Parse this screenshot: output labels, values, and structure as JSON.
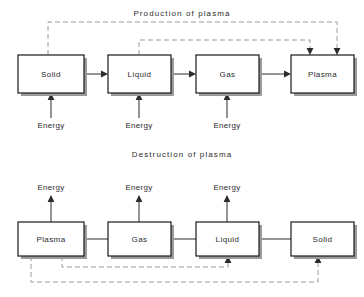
{
  "figure": {
    "title_top": "Production of  plasma",
    "title_bottom": "Destruction of  plasma"
  },
  "production": {
    "title": "Production of  plasma",
    "states": [
      {
        "label": "Solid",
        "x": 18,
        "y": 55,
        "w": 66,
        "h": 38
      },
      {
        "label": "Liquid",
        "x": 108,
        "y": 55,
        "w": 63,
        "h": 38
      },
      {
        "label": "Gas",
        "x": 196,
        "y": 55,
        "w": 63,
        "h": 38
      },
      {
        "label": "Plasma",
        "x": 291,
        "y": 55,
        "w": 63,
        "h": 38
      }
    ],
    "energy_inputs": [
      {
        "label": "Energy",
        "x": 51,
        "label_y": 126
      },
      {
        "label": "Energy",
        "x": 139,
        "label_y": 126
      },
      {
        "label": "Energy",
        "x": 227,
        "label_y": 126
      }
    ],
    "transitions": [
      {
        "from": "Solid",
        "to": "Liquid",
        "arrow": true
      },
      {
        "from": "Liquid",
        "to": "Gas",
        "arrow": true
      },
      {
        "from": "Gas",
        "to": "Plasma",
        "arrow": true
      }
    ],
    "feedback_paths": [
      {
        "from": "Solid",
        "to": "Plasma",
        "style": "dashed",
        "level_y": 22,
        "down_x": 337
      },
      {
        "from": "Liquid",
        "to": "Plasma",
        "style": "dashed",
        "level_y": 40,
        "down_x": 310
      }
    ]
  },
  "destruction": {
    "title": "Destruction of  plasma",
    "states": [
      {
        "label": "Plasma",
        "x": 18,
        "y": 222,
        "w": 66,
        "h": 34
      },
      {
        "label": "Gas",
        "x": 108,
        "y": 222,
        "w": 63,
        "h": 34
      },
      {
        "label": "Liquid",
        "x": 196,
        "y": 222,
        "w": 63,
        "h": 34
      },
      {
        "label": "Solid",
        "x": 291,
        "y": 222,
        "w": 63,
        "h": 34
      }
    ],
    "energy_outputs": [
      {
        "label": "Energy",
        "x": 51,
        "label_y": 188
      },
      {
        "label": "Energy",
        "x": 139,
        "label_y": 188
      },
      {
        "label": "Energy",
        "x": 227,
        "label_y": 188
      }
    ],
    "transitions": [
      {
        "from": "Plasma",
        "to": "Gas",
        "arrow": false
      },
      {
        "from": "Gas",
        "to": "Liquid",
        "arrow": false
      },
      {
        "from": "Liquid",
        "to": "Solid",
        "arrow": false
      }
    ],
    "feedback_paths": [
      {
        "from": "Plasma",
        "to": "Liquid",
        "style": "dashed",
        "level_y": 267,
        "down_x": 62,
        "up_x": 228
      },
      {
        "from": "Plasma",
        "to": "Solid",
        "style": "dashed",
        "level_y": 282,
        "down_x": 31,
        "up_x": 318
      }
    ]
  },
  "colors": {
    "line": "#2b2b2b",
    "dashed": "#9a9a9a",
    "text": "#2b2b2b",
    "box_fill": "#ffffff",
    "shadow": "#9b9b9b"
  }
}
